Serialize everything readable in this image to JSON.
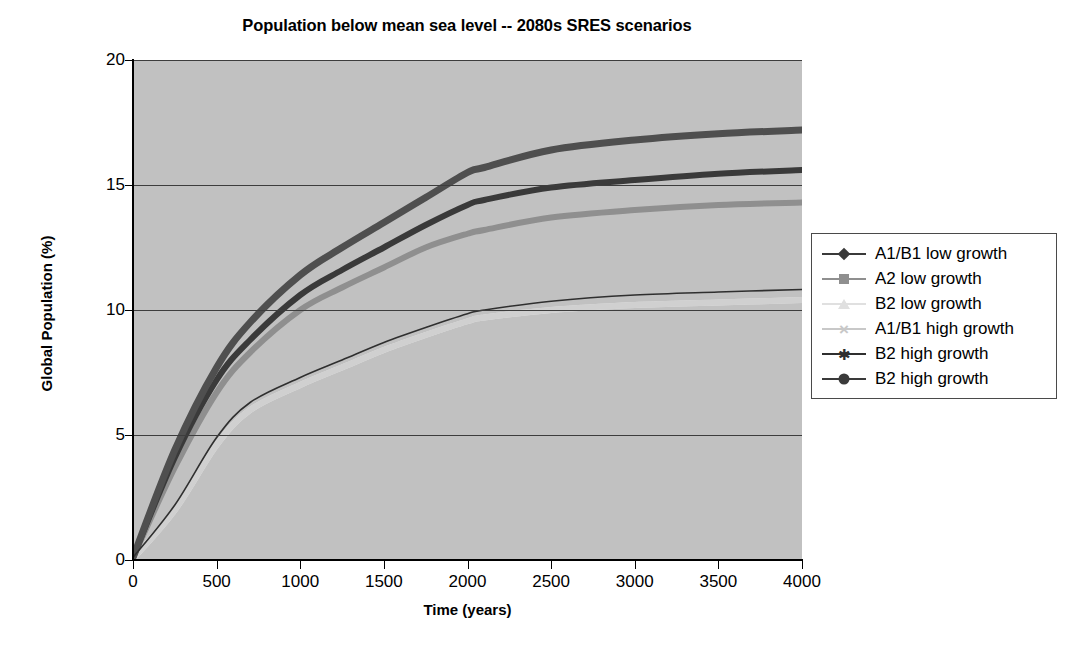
{
  "chart_data": {
    "type": "line",
    "title": "Population below mean sea level -- 2080s SRES scenarios",
    "xlabel": "Time (years)",
    "ylabel": "Global Population (%)",
    "xlim": [
      0,
      4000
    ],
    "ylim": [
      0,
      20
    ],
    "xticks": [
      0,
      500,
      1000,
      1500,
      2000,
      2500,
      3000,
      3500,
      4000
    ],
    "yticks": [
      0,
      5,
      10,
      15,
      20
    ],
    "grid": "horizontal",
    "plot_background": "#c1c1c1",
    "legend_position": "right-outside",
    "x": [
      0,
      250,
      500,
      700,
      1000,
      1250,
      1500,
      1750,
      2000,
      2100,
      2500,
      3000,
      3500,
      4000
    ],
    "series": [
      {
        "name": "A1/B1 low growth",
        "marker": "diamond",
        "color": "#3a3a3a",
        "line_width": 6,
        "values": [
          0.1,
          4.1,
          7.2,
          8.8,
          10.6,
          11.6,
          12.5,
          13.4,
          14.2,
          14.4,
          14.9,
          15.2,
          15.45,
          15.6
        ]
      },
      {
        "name": "A2 low growth",
        "marker": "square",
        "color": "#8f8f8f",
        "line_width": 6,
        "values": [
          0.1,
          3.7,
          6.7,
          8.3,
          10.0,
          10.9,
          11.7,
          12.5,
          13.05,
          13.2,
          13.7,
          14.0,
          14.2,
          14.3
        ]
      },
      {
        "name": "B2 low growth",
        "marker": "triangle",
        "color": "#e3e3e3",
        "line_width": 6,
        "values": [
          0.05,
          2.0,
          4.6,
          6.0,
          7.0,
          7.7,
          8.4,
          9.0,
          9.55,
          9.7,
          10.0,
          10.2,
          10.3,
          10.4
        ]
      },
      {
        "name": "A1/B1 high growth",
        "marker": "x",
        "color": "#d0d0d0",
        "line_width": 6,
        "values": [
          0.05,
          2.0,
          4.6,
          6.0,
          7.0,
          7.7,
          8.4,
          9.0,
          9.55,
          9.7,
          10.0,
          10.2,
          10.3,
          10.4
        ]
      },
      {
        "name": "B2 high growth",
        "marker": "asterisk",
        "color": "#2f2f2f",
        "line_width": 1.6,
        "values": [
          0.1,
          2.2,
          4.9,
          6.3,
          7.3,
          8.0,
          8.7,
          9.3,
          9.85,
          10.0,
          10.35,
          10.6,
          10.72,
          10.82
        ]
      },
      {
        "name": "B2 high growth",
        "marker": "circle",
        "color": "#4f4f4f",
        "line_width": 7,
        "values": [
          0.1,
          4.4,
          7.7,
          9.5,
          11.4,
          12.5,
          13.5,
          14.5,
          15.5,
          15.7,
          16.4,
          16.8,
          17.05,
          17.2
        ]
      }
    ]
  },
  "legend": {
    "entries": [
      {
        "label": "A1/B1 low growth",
        "marker": "diamond",
        "color": "#3a3a3a"
      },
      {
        "label": "A2 low growth",
        "marker": "square",
        "color": "#8f8f8f"
      },
      {
        "label": "B2 low growth",
        "marker": "triangle",
        "color": "#e0e0e0"
      },
      {
        "label": "A1/B1 high growth",
        "marker": "x",
        "color": "#c8c8c8"
      },
      {
        "label": "B2 high growth",
        "marker": "asterisk",
        "color": "#2f2f2f"
      },
      {
        "label": "B2 high growth",
        "marker": "circle",
        "color": "#3a3a3a"
      }
    ]
  },
  "caption": {
    "text": ""
  }
}
